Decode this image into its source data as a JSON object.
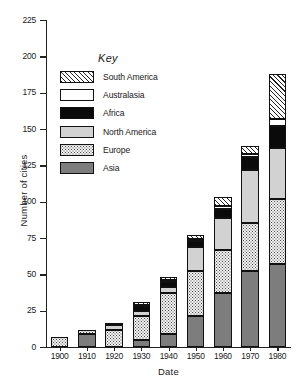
{
  "chart_data": {
    "type": "bar",
    "subtype": "stacked-bar",
    "title": "",
    "xlabel": "Date",
    "ylabel": "Number of cities",
    "categories": [
      "1900",
      "1910",
      "1920",
      "1930",
      "1940",
      "1950",
      "1960",
      "1970",
      "1980"
    ],
    "ylim": [
      0,
      225
    ],
    "ytick_labels": [
      "0",
      "25",
      "50",
      "75",
      "100",
      "125",
      "150",
      "175",
      "200",
      "225"
    ],
    "ytick_values": [
      0,
      25,
      50,
      75,
      100,
      125,
      150,
      175,
      200,
      225
    ],
    "grid": false,
    "legend_title": "Key",
    "legend_position": "inside-upper-left",
    "stack_order_bottom_to_top": [
      "Asia",
      "Europe",
      "North America",
      "Africa",
      "Australasia",
      "South America"
    ],
    "series": [
      {
        "name": "Asia",
        "pattern": "solid-dark-grey",
        "color": "#7d7d7d",
        "values": [
          0,
          9,
          0,
          5,
          9,
          21,
          37,
          52,
          57
        ]
      },
      {
        "name": "Europe",
        "pattern": "fine-dots",
        "color": "#f2f2f2",
        "values": [
          7,
          3,
          12,
          16,
          28,
          31,
          30,
          33,
          45
        ]
      },
      {
        "name": "North America",
        "pattern": "solid-light-grey",
        "color": "#d2d2d2",
        "values": [
          0,
          0,
          3,
          4,
          4,
          17,
          22,
          37,
          35
        ]
      },
      {
        "name": "Africa",
        "pattern": "solid-black",
        "color": "#0a0a0a",
        "values": [
          0,
          0,
          1,
          3,
          4,
          4,
          6,
          9,
          15
        ]
      },
      {
        "name": "Australasia",
        "pattern": "white",
        "color": "#ffffff",
        "values": [
          0,
          0,
          0,
          1,
          1,
          1,
          2,
          2,
          5
        ]
      },
      {
        "name": "South America",
        "pattern": "diagonal-hatch",
        "color": "#ffffff",
        "values": [
          0,
          0,
          0,
          2,
          2,
          3,
          6,
          5,
          31
        ]
      }
    ],
    "totals": [
      7,
      12,
      16,
      31,
      48,
      77,
      103,
      138,
      188
    ]
  },
  "legend": {
    "title": "Key",
    "items": [
      {
        "label": "South America"
      },
      {
        "label": "Australasia"
      },
      {
        "label": "Africa"
      },
      {
        "label": "North America"
      },
      {
        "label": "Europe"
      },
      {
        "label": "Asia"
      }
    ]
  }
}
